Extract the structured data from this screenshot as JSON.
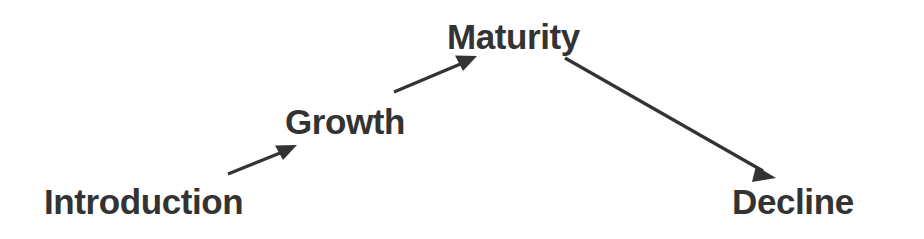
{
  "diagram": {
    "type": "flow",
    "background_color": "#ffffff",
    "text_color": "#333333",
    "arrow_color": "#333333",
    "stages": [
      {
        "id": "introduction",
        "label": "Introduction"
      },
      {
        "id": "growth",
        "label": "Growth"
      },
      {
        "id": "maturity",
        "label": "Maturity"
      },
      {
        "id": "decline",
        "label": "Decline"
      }
    ],
    "connections": [
      {
        "from": "introduction",
        "to": "growth",
        "direction": "up-right",
        "icon": "arrow-up-right-icon"
      },
      {
        "from": "growth",
        "to": "maturity",
        "direction": "up-right",
        "icon": "arrow-up-right-icon"
      },
      {
        "from": "maturity",
        "to": "decline",
        "direction": "down-right",
        "icon": "arrow-down-right-icon"
      }
    ]
  }
}
